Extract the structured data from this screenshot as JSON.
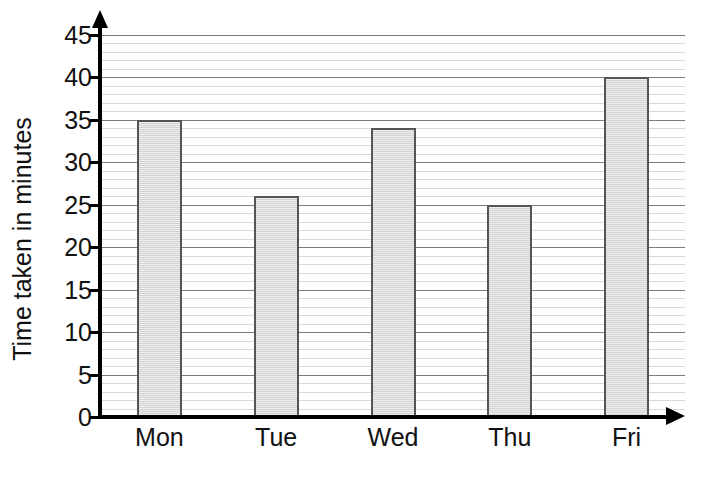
{
  "chart_data": {
    "type": "bar",
    "title": "",
    "subtitle": "",
    "xlabel": "",
    "ylabel": "Time taken in minutes",
    "categories": [
      "Mon",
      "Tue",
      "Wed",
      "Thu",
      "Fri"
    ],
    "values": [
      35,
      26,
      34,
      25,
      40
    ],
    "ylim": [
      0,
      45
    ],
    "ytick_interval": 5,
    "yticks": [
      0,
      5,
      10,
      15,
      20,
      25,
      30,
      35,
      40,
      45
    ],
    "ytick_labels": [
      "0",
      "5",
      "10",
      "15",
      "20",
      "25",
      "30",
      "35",
      "40",
      "45"
    ],
    "minor_gridline_interval": 1,
    "grid": true,
    "grid_axis": "y",
    "legend": false,
    "legend_position": "none",
    "orientation": "vertical",
    "series": [
      {
        "name": "Time taken",
        "values": [
          35,
          26,
          34,
          25,
          40
        ]
      }
    ],
    "annotations": [],
    "colors": {
      "bar_fill": "#dadada",
      "bar_stroke": "#555555",
      "axis": "#000000",
      "major_gridline": "#7d7d7d",
      "minor_gridline": "#d9d9d9",
      "text": "#111111",
      "background": "#ffffff"
    },
    "axis_arrows": {
      "y": "up-arrow-icon",
      "x": "right-arrow-icon"
    }
  }
}
